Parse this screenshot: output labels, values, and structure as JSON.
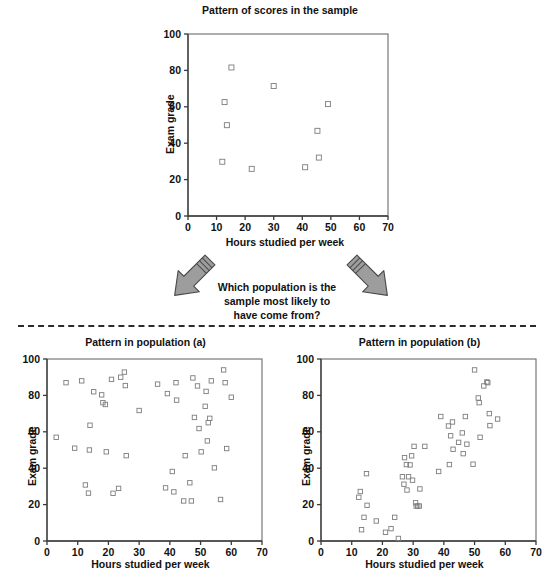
{
  "figure": {
    "question": "Which population is the\nsample most likely to\nhave come from?",
    "arrow_color": "#9d9d9d",
    "arrow_outline": "#4a4a4a",
    "divider_color": "#2b2b2b",
    "marker_color": "#7d7d7d",
    "axis_color": "#3a3a3a"
  },
  "chart_data": [
    {
      "id": "sample",
      "type": "scatter",
      "title": "Pattern of scores in the sample",
      "xlabel": "Hours studied per week",
      "ylabel": "Exam grade",
      "xlim": [
        0,
        70
      ],
      "ylim": [
        0,
        100
      ],
      "xticks": [
        0,
        10,
        20,
        30,
        40,
        50,
        60,
        70
      ],
      "yticks": [
        0,
        20,
        40,
        60,
        80,
        100
      ],
      "grid": false,
      "legend": "none",
      "points": [
        [
          15.2,
          81.6
        ],
        [
          30.0,
          71.4
        ],
        [
          12.8,
          62.6
        ],
        [
          49.0,
          61.5
        ],
        [
          13.6,
          49.9
        ],
        [
          45.3,
          46.8
        ],
        [
          45.8,
          32.1
        ],
        [
          12.0,
          29.8
        ],
        [
          41.0,
          26.8
        ],
        [
          22.3,
          25.9
        ]
      ]
    },
    {
      "id": "population-a",
      "type": "scatter",
      "title": "Pattern in population (a)",
      "xlabel": "Hours studied per week",
      "ylabel": "Exam grade",
      "xlim": [
        0,
        70
      ],
      "ylim": [
        0,
        100
      ],
      "xticks": [
        0,
        10,
        20,
        30,
        40,
        50,
        60,
        70
      ],
      "yticks": [
        0,
        20,
        40,
        60,
        80,
        100
      ],
      "grid": false,
      "legend": "none",
      "points": [
        [
          3.0,
          57.0
        ],
        [
          6.2,
          87.0
        ],
        [
          9.0,
          51.0
        ],
        [
          11.3,
          88.0
        ],
        [
          12.5,
          30.8
        ],
        [
          13.5,
          26.3
        ],
        [
          13.8,
          50.0
        ],
        [
          14.0,
          63.6
        ],
        [
          15.2,
          82.0
        ],
        [
          17.8,
          80.3
        ],
        [
          18.2,
          76.0
        ],
        [
          19.0,
          75.0
        ],
        [
          19.3,
          49.0
        ],
        [
          21.0,
          88.8
        ],
        [
          21.5,
          26.2
        ],
        [
          23.3,
          28.9
        ],
        [
          24.0,
          90.0
        ],
        [
          25.2,
          92.8
        ],
        [
          25.5,
          85.4
        ],
        [
          25.8,
          46.9
        ],
        [
          30.0,
          71.7
        ],
        [
          36.0,
          86.2
        ],
        [
          38.6,
          29.2
        ],
        [
          39.2,
          81.0
        ],
        [
          40.8,
          38.2
        ],
        [
          41.3,
          27.0
        ],
        [
          42.0,
          87.0
        ],
        [
          42.2,
          77.4
        ],
        [
          44.5,
          22.0
        ],
        [
          45.0,
          46.9
        ],
        [
          46.5,
          32.0
        ],
        [
          47.0,
          22.0
        ],
        [
          47.5,
          89.6
        ],
        [
          48.0,
          67.9
        ],
        [
          49.0,
          85.2
        ],
        [
          49.5,
          61.8
        ],
        [
          50.2,
          49.0
        ],
        [
          51.5,
          74.0
        ],
        [
          51.8,
          82.2
        ],
        [
          52.2,
          55.0
        ],
        [
          52.5,
          65.0
        ],
        [
          53.0,
          67.4
        ],
        [
          53.5,
          88.0
        ],
        [
          54.5,
          40.2
        ],
        [
          56.5,
          22.8
        ],
        [
          57.5,
          94.0
        ],
        [
          58.0,
          87.0
        ],
        [
          58.5,
          50.8
        ],
        [
          60.0,
          79.0
        ]
      ]
    },
    {
      "id": "population-b",
      "type": "scatter",
      "title": "Pattern in population (b)",
      "xlabel": "Hours studied per week",
      "ylabel": "Exam grade",
      "xlim": [
        0,
        70
      ],
      "ylim": [
        0,
        100
      ],
      "xticks": [
        0,
        10,
        20,
        30,
        40,
        50,
        60,
        70
      ],
      "yticks": [
        0,
        20,
        40,
        60,
        80,
        100
      ],
      "grid": false,
      "legend": "none",
      "points": [
        [
          12.3,
          24.0
        ],
        [
          12.8,
          27.2
        ],
        [
          13.2,
          6.2
        ],
        [
          14.0,
          13.0
        ],
        [
          14.8,
          37.0
        ],
        [
          15.0,
          19.6
        ],
        [
          18.0,
          11.0
        ],
        [
          21.0,
          4.8
        ],
        [
          22.8,
          6.8
        ],
        [
          24.0,
          13.0
        ],
        [
          25.2,
          1.4
        ],
        [
          26.5,
          35.3
        ],
        [
          27.0,
          31.2
        ],
        [
          27.2,
          45.8
        ],
        [
          27.8,
          42.0
        ],
        [
          28.0,
          28.0
        ],
        [
          28.5,
          35.3
        ],
        [
          29.0,
          41.8
        ],
        [
          29.5,
          46.8
        ],
        [
          29.8,
          33.4
        ],
        [
          30.3,
          52.0
        ],
        [
          30.8,
          21.0
        ],
        [
          31.0,
          19.2
        ],
        [
          31.5,
          19.2
        ],
        [
          32.0,
          19.2
        ],
        [
          32.2,
          28.6
        ],
        [
          33.8,
          52.0
        ],
        [
          38.3,
          38.2
        ],
        [
          39.0,
          68.4
        ],
        [
          41.5,
          63.2
        ],
        [
          41.8,
          42.0
        ],
        [
          42.2,
          57.8
        ],
        [
          42.8,
          65.4
        ],
        [
          43.0,
          50.4
        ],
        [
          44.8,
          54.2
        ],
        [
          46.0,
          59.4
        ],
        [
          46.3,
          48.0
        ],
        [
          47.0,
          68.4
        ],
        [
          47.5,
          53.2
        ],
        [
          49.5,
          42.2
        ],
        [
          50.0,
          94.0
        ],
        [
          51.2,
          78.6
        ],
        [
          51.5,
          76.0
        ],
        [
          51.8,
          57.0
        ],
        [
          53.0,
          85.2
        ],
        [
          54.0,
          87.4
        ],
        [
          54.3,
          87.0
        ],
        [
          54.8,
          70.0
        ],
        [
          55.0,
          63.4
        ],
        [
          57.5,
          67.0
        ]
      ]
    }
  ]
}
